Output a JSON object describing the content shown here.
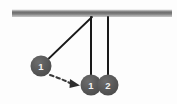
{
  "diagram": {
    "background_color": "#fdfdfd",
    "support_beam": {
      "name": "horizontal support beam",
      "color_top": "#d9d9d9",
      "color_mid": "#6e6e6e",
      "color_bottom": "#c9c9c9",
      "x": 12,
      "y": 9,
      "width": 160,
      "height": 8
    },
    "pivot": {
      "x": 92,
      "y": 17
    },
    "strings": [
      {
        "name": "raised-pendulum-string",
        "color": "#1a1a1a",
        "x1": 92,
        "y1": 17,
        "x2": 41,
        "y2": 66
      },
      {
        "name": "resting-string-1",
        "color": "#1a1a1a",
        "x1": 91,
        "y1": 17,
        "x2": 91,
        "y2": 85
      },
      {
        "name": "resting-string-2",
        "color": "#1a1a1a",
        "x1": 108,
        "y1": 17,
        "x2": 108,
        "y2": 85
      }
    ],
    "balls": [
      {
        "name": "raised-ball",
        "label": "1",
        "cx": 41,
        "cy": 66,
        "r": 10,
        "color": "#5a5a5a"
      },
      {
        "name": "resting-ball-1",
        "label": "1",
        "cx": 91,
        "cy": 85,
        "r": 10,
        "color": "#5a5a5a"
      },
      {
        "name": "resting-ball-2",
        "label": "2",
        "cx": 108,
        "cy": 85,
        "r": 10,
        "color": "#5a5a5a"
      }
    ],
    "motion_arrow": {
      "name": "swing-direction-arrow",
      "style": "dashed",
      "color": "#3a3a3a",
      "path": "M 50 75 Q 62 79 72 84",
      "arrowhead": "M 72 80 L 80 85 L 71 88 Z"
    }
  }
}
